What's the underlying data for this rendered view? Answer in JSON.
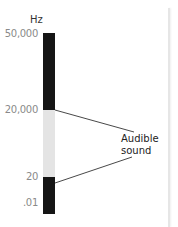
{
  "diagram": {
    "title_fragment": "",
    "unit_label": "Hz",
    "ticks": [
      {
        "label": "50,000",
        "y": 28
      },
      {
        "label": "20,000",
        "y": 104
      },
      {
        "label": "20",
        "y": 171
      },
      {
        "label": ".01",
        "y": 197
      }
    ],
    "segments": [
      {
        "name": "ultrasound",
        "color": "#151515",
        "from_label": "50,000",
        "to_label": "20,000"
      },
      {
        "name": "audible",
        "color": "#e4e4e4",
        "from_label": "20,000",
        "to_label": "20"
      },
      {
        "name": "infrasound",
        "color": "#151515",
        "from_label": "20",
        "to_label": ".01"
      }
    ],
    "annotation": {
      "line1": "Audible",
      "line2": "sound",
      "points_to": [
        "20,000",
        "20"
      ]
    }
  }
}
